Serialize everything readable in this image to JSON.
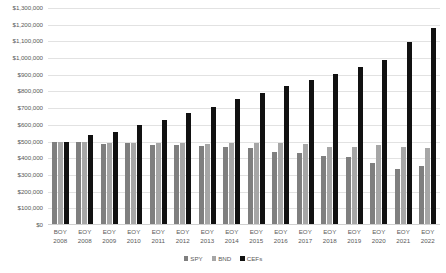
{
  "chart_data": {
    "type": "bar",
    "title": "",
    "xlabel": "",
    "ylabel": "",
    "ylim": [
      0,
      1300000
    ],
    "ytick_step": 100000,
    "grid": true,
    "legend_position": "bottom",
    "ytick_labels": [
      "$1,300,000",
      "$1,200,000",
      "$1,100,000",
      "$1,000,000",
      "$900,000",
      "$800,000",
      "$700,000",
      "$600,000",
      "$500,000",
      "$400,000",
      "$300,000",
      "$200,000",
      "$100,000",
      "$0"
    ],
    "ytick_values": [
      1300000,
      1200000,
      1100000,
      1000000,
      900000,
      800000,
      700000,
      600000,
      500000,
      400000,
      300000,
      200000,
      100000,
      0
    ],
    "categories": [
      {
        "line1": "BOY",
        "line2": "2008"
      },
      {
        "line1": "EOY",
        "line2": "2008"
      },
      {
        "line1": "EOY",
        "line2": "2009"
      },
      {
        "line1": "EOY",
        "line2": "2010"
      },
      {
        "line1": "EOY",
        "line2": "2011"
      },
      {
        "line1": "EOY",
        "line2": "2012"
      },
      {
        "line1": "EOY",
        "line2": "2013"
      },
      {
        "line1": "EOY",
        "line2": "2014"
      },
      {
        "line1": "EOY",
        "line2": "2015"
      },
      {
        "line1": "EOY",
        "line2": "2016"
      },
      {
        "line1": "EOY",
        "line2": "2017"
      },
      {
        "line1": "EOY",
        "line2": "2018"
      },
      {
        "line1": "EOY",
        "line2": "2019"
      },
      {
        "line1": "EOY",
        "line2": "2020"
      },
      {
        "line1": "EOY",
        "line2": "2021"
      },
      {
        "line1": "EOY",
        "line2": "2022"
      }
    ],
    "series": [
      {
        "name": "SPY",
        "color": "#7f7f7f",
        "values": [
          500000,
          495000,
          485000,
          490000,
          480000,
          480000,
          475000,
          470000,
          460000,
          435000,
          430000,
          415000,
          405000,
          370000,
          335000,
          355000
        ]
      },
      {
        "name": "BND",
        "color": "#a6a6a6",
        "values": [
          500000,
          495000,
          490000,
          490000,
          490000,
          490000,
          485000,
          490000,
          490000,
          490000,
          485000,
          465000,
          470000,
          480000,
          465000,
          460000
        ]
      },
      {
        "name": "CEFs",
        "color": "#111111",
        "values": [
          500000,
          540000,
          560000,
          600000,
          630000,
          670000,
          705000,
          755000,
          790000,
          830000,
          870000,
          905000,
          945000,
          990000,
          1095000,
          1180000
        ]
      }
    ]
  },
  "legend": {
    "items": [
      {
        "label": "SPY"
      },
      {
        "label": "BND"
      },
      {
        "label": "CEFs"
      }
    ]
  }
}
